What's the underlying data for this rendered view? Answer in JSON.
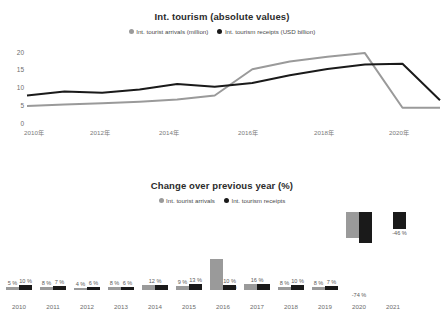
{
  "chart_data": [
    {
      "type": "line",
      "title": "Int. tourism (absolute values)",
      "xlabel": "",
      "ylabel": "",
      "ylim": [
        0,
        25
      ],
      "yticks": [
        "0",
        "5",
        "10",
        "15",
        "20"
      ],
      "grid": false,
      "legend_position": "top",
      "x": [
        "2010",
        "2011",
        "2012",
        "2013",
        "2014",
        "2015",
        "2016",
        "2017",
        "2018",
        "2019",
        "2020",
        "2021"
      ],
      "xtick_labels": [
        "2010年",
        "2012年",
        "2014年",
        "2016年",
        "2018年",
        "2020年"
      ],
      "series": [
        {
          "name": "Int. tourist arrivals (million)",
          "color": "#9a9a9a",
          "values": [
            6.7,
            7.2,
            7.6,
            8.1,
            8.8,
            10.1,
            18.5,
            21.0,
            22.5,
            23.7,
            6.2,
            6.2
          ]
        },
        {
          "name": "Int. tourism receipts (USD billion)",
          "color": "#1a1a1a",
          "values": [
            10.1,
            11.4,
            11.0,
            12.0,
            13.8,
            12.9,
            14.1,
            16.6,
            18.6,
            20.0,
            20.3,
            8.6
          ]
        }
      ]
    },
    {
      "type": "bar",
      "title": "Change over previous year (%)",
      "xlabel": "",
      "ylabel": "",
      "grid": false,
      "legend_position": "top",
      "categories": [
        "2010",
        "2011",
        "2012",
        "2013",
        "2014",
        "2015",
        "2016",
        "2017",
        "2018",
        "2019",
        "2020",
        "2021"
      ],
      "series": [
        {
          "name": "Int. tourist arrivals",
          "color": "#9a9a9a",
          "values": [
            5,
            8,
            4,
            8,
            12,
            9,
            79,
            16,
            8,
            8,
            -74,
            null
          ],
          "labels": [
            "5 %",
            "8 %",
            "4 %",
            "8 %",
            "12 %",
            "9 %",
            "79 %",
            "16 %",
            "8 %",
            "8 %",
            "-74 %",
            ""
          ]
        },
        {
          "name": "Int. tourism receipts",
          "color": "#1a1a1a",
          "values": [
            10,
            7,
            6,
            6,
            12,
            13,
            10,
            16,
            10,
            7,
            -74,
            -46
          ],
          "labels": [
            "10 %",
            "7 %",
            "6 %",
            "6 %",
            "",
            "13 %",
            "10 %",
            "",
            "10 %",
            "7 %",
            "",
            "-46 %"
          ]
        }
      ]
    }
  ],
  "line_chart": {
    "title": "Int. tourism (absolute values)",
    "legend": [
      {
        "label": "Int. tourist arrivals (million)",
        "color": "#9a9a9a"
      },
      {
        "label": "Int. tourism receipts (USD billion)",
        "color": "#1a1a1a"
      }
    ],
    "yticks": [
      {
        "label": "20",
        "top": 10
      },
      {
        "label": "15",
        "top": 27
      },
      {
        "label": "10",
        "top": 45
      },
      {
        "label": "5",
        "top": 63
      },
      {
        "label": "0",
        "top": 81
      }
    ],
    "xticks": [
      {
        "label": "2010年",
        "left": 34
      },
      {
        "label": "2012年",
        "left": 100
      },
      {
        "label": "2014年",
        "left": 169
      },
      {
        "label": "2016年",
        "left": 248
      },
      {
        "label": "2018年",
        "left": 324
      },
      {
        "label": "2020年",
        "left": 399
      }
    ]
  },
  "bar_chart": {
    "title": "Change over previous year (%)",
    "legend": [
      {
        "label": "Int. tourist arrivals",
        "color": "#9a9a9a"
      },
      {
        "label": "Int. tourism receipts",
        "color": "#1a1a1a"
      }
    ],
    "groups": [
      {
        "year": "2010",
        "left": 4,
        "a_label": "5 %",
        "b_label": "10 %",
        "a_h": 3,
        "b_h": 5,
        "note": ""
      },
      {
        "year": "2011",
        "left": 38,
        "a_label": "8 %",
        "b_label": "7 %",
        "a_h": 3,
        "b_h": 4,
        "note": ""
      },
      {
        "year": "2012",
        "left": 72,
        "a_label": "4 %",
        "b_label": "6 %",
        "a_h": 2,
        "b_h": 3,
        "note": ""
      },
      {
        "year": "2013",
        "left": 106,
        "a_label": "8 %",
        "b_label": "6 %",
        "a_h": 3,
        "b_h": 3,
        "note": ""
      },
      {
        "year": "2014",
        "left": 140,
        "a_label": "",
        "b_label": "",
        "a_h": 5,
        "b_h": 5,
        "note": "12 %"
      },
      {
        "year": "2015",
        "left": 174,
        "a_label": "9 %",
        "b_label": "13 %",
        "a_h": 4,
        "b_h": 6,
        "note": ""
      },
      {
        "year": "2016",
        "left": 208,
        "a_label": "79 %",
        "b_label": "10 %",
        "a_h": 31,
        "b_h": 5,
        "note": ""
      },
      {
        "year": "2017",
        "left": 242,
        "a_label": "",
        "b_label": "",
        "a_h": 6,
        "b_h": 6,
        "note": "16 %"
      },
      {
        "year": "2018",
        "left": 276,
        "a_label": "8 %",
        "b_label": "10 %",
        "a_h": 3,
        "b_h": 5,
        "note": ""
      },
      {
        "year": "2019",
        "left": 310,
        "a_label": "8 %",
        "b_label": "7 %",
        "a_h": 3,
        "b_h": 4,
        "note": ""
      },
      {
        "year": "2020",
        "left": 344,
        "a_label": "",
        "b_label": "",
        "a_h": 26,
        "b_h": 31,
        "note": "-74 %"
      },
      {
        "year": "2021",
        "left": 378,
        "a_label": "",
        "b_label": "-46 %",
        "a_h": 0,
        "b_h": 17,
        "note": ""
      }
    ]
  }
}
